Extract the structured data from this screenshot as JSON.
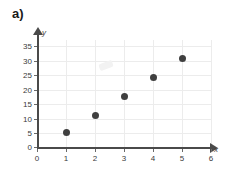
{
  "panel": {
    "label": "a)"
  },
  "chart_data": {
    "type": "scatter",
    "title": "",
    "subtitle": "",
    "xlabel": "x",
    "ylabel": "y",
    "x": [
      1,
      2,
      3,
      4,
      5
    ],
    "values": [
      5,
      11,
      17.5,
      24,
      30.5
    ],
    "points": [
      {
        "x": 1,
        "y": 5
      },
      {
        "x": 2,
        "y": 11
      },
      {
        "x": 3,
        "y": 17.5
      },
      {
        "x": 4,
        "y": 24
      },
      {
        "x": 5,
        "y": 30.5
      }
    ],
    "xlim": [
      0,
      6
    ],
    "ylim": [
      0,
      35
    ],
    "xticks": [
      "0",
      "1",
      "2",
      "3",
      "4",
      "5",
      "6"
    ],
    "yticks": [
      "0",
      "5",
      "10",
      "15",
      "20",
      "25",
      "30",
      "35"
    ],
    "grid": true,
    "legend": false,
    "legend_position": "none",
    "marker": "filled-circle",
    "marker_color": "#3f3f3f",
    "grid_color": "#ececec",
    "axis_color": "#4a4a4a",
    "background_color": "#ffffff",
    "annotations": []
  },
  "axis_labels": {
    "y_ticks": [
      {
        "label": "35",
        "top": 42
      },
      {
        "label": "30",
        "top": 57
      },
      {
        "label": "25",
        "top": 71
      },
      {
        "label": "20",
        "top": 86
      },
      {
        "label": "15",
        "top": 100
      },
      {
        "label": "10",
        "top": 115
      },
      {
        "label": "5",
        "top": 129
      },
      {
        "label": "0",
        "top": 144
      }
    ],
    "x_ticks": [
      {
        "label": "0",
        "left": 31
      },
      {
        "label": "1",
        "left": 60
      },
      {
        "label": "2",
        "left": 89
      },
      {
        "label": "3",
        "left": 118
      },
      {
        "label": "4",
        "left": 147
      },
      {
        "label": "5",
        "left": 176
      },
      {
        "label": "6",
        "left": 205
      }
    ]
  }
}
